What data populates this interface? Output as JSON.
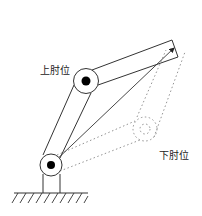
{
  "diagram": {
    "type": "robot-arm-elbow-configurations",
    "labels": {
      "elbow_up": "上肘位",
      "elbow_down": "下肘位"
    },
    "colors": {
      "line": "#333333",
      "dashed": "#888888",
      "joint_fill": "#000000",
      "background": "#ffffff"
    }
  }
}
